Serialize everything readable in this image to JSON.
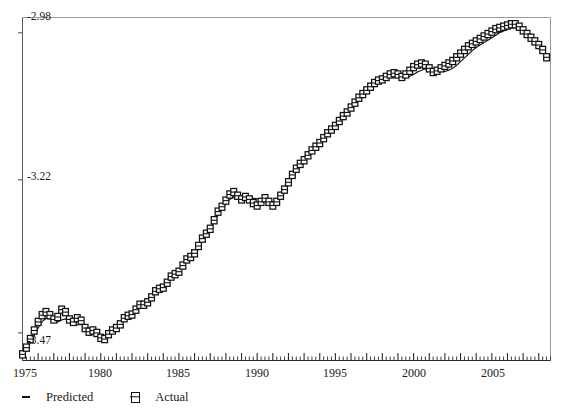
{
  "chart_data": {
    "type": "line",
    "title": "",
    "xlabel": "",
    "ylabel": "",
    "xlim": [
      1975.0,
      2008.75
    ],
    "ylim": [
      -3.515,
      -2.955
    ],
    "grid": false,
    "legend_position": "bottom-left",
    "y_ticks": [
      -2.98,
      -3.22,
      -3.47
    ],
    "y_tick_labels": [
      "-2.98",
      "-3.22",
      "-3.47"
    ],
    "x_ticks": [
      1975,
      1980,
      1985,
      1990,
      1995,
      2000,
      2005
    ],
    "x_tick_labels": [
      "1975",
      "1980",
      "1985",
      "1990",
      "1995",
      "2000",
      "2005"
    ],
    "x_minor_tick_interval": 0.25,
    "x_major_tick_interval": 1,
    "series": [
      {
        "name": "Predicted",
        "marker": "dash",
        "color": "#111111",
        "x": [
          1975.0,
          1975.25,
          1975.5,
          1975.75,
          1976.0,
          1976.25,
          1976.5,
          1976.75,
          1977.0,
          1977.25,
          1977.5,
          1977.75,
          1978.0,
          1978.25,
          1978.5,
          1978.75,
          1979.0,
          1979.25,
          1979.5,
          1979.75,
          1980.0,
          1980.25,
          1980.5,
          1980.75,
          1981.0,
          1981.25,
          1981.5,
          1981.75,
          1982.0,
          1982.25,
          1982.5,
          1982.75,
          1983.0,
          1983.25,
          1983.5,
          1983.75,
          1984.0,
          1984.25,
          1984.5,
          1984.75,
          1985.0,
          1985.25,
          1985.5,
          1985.75,
          1986.0,
          1986.25,
          1986.5,
          1986.75,
          1987.0,
          1987.25,
          1987.5,
          1987.75,
          1988.0,
          1988.25,
          1988.5,
          1988.75,
          1989.0,
          1989.25,
          1989.5,
          1989.75,
          1990.0,
          1990.25,
          1990.5,
          1990.75,
          1991.0,
          1991.25,
          1991.5,
          1991.75,
          1992.0,
          1992.25,
          1992.5,
          1992.75,
          1993.0,
          1993.25,
          1993.5,
          1993.75,
          1994.0,
          1994.25,
          1994.5,
          1994.75,
          1995.0,
          1995.25,
          1995.5,
          1995.75,
          1996.0,
          1996.25,
          1996.5,
          1996.75,
          1997.0,
          1997.25,
          1997.5,
          1997.75,
          1998.0,
          1998.25,
          1998.5,
          1998.75,
          1999.0,
          1999.25,
          1999.5,
          1999.75,
          2000.0,
          2000.25,
          2000.5,
          2000.75,
          2001.0,
          2001.25,
          2001.5,
          2001.75,
          2002.0,
          2002.25,
          2002.5,
          2002.75,
          2003.0,
          2003.25,
          2003.5,
          2003.75,
          2004.0,
          2004.25,
          2004.5,
          2004.75,
          2005.0,
          2005.25,
          2005.5,
          2005.75,
          2006.0,
          2006.25,
          2006.5,
          2006.75,
          2007.0,
          2007.25,
          2007.5,
          2007.75,
          2008.0,
          2008.25,
          2008.5
        ],
        "y": [
          -3.503,
          -3.496,
          -3.487,
          -3.475,
          -3.462,
          -3.452,
          -3.446,
          -3.447,
          -3.451,
          -3.452,
          -3.449,
          -3.447,
          -3.449,
          -3.454,
          -3.457,
          -3.456,
          -3.458,
          -3.463,
          -3.468,
          -3.472,
          -3.474,
          -3.475,
          -3.474,
          -3.47,
          -3.464,
          -3.457,
          -3.45,
          -3.444,
          -3.438,
          -3.432,
          -3.427,
          -3.423,
          -3.418,
          -3.412,
          -3.405,
          -3.398,
          -3.392,
          -3.386,
          -3.38,
          -3.374,
          -3.367,
          -3.36,
          -3.353,
          -3.346,
          -3.338,
          -3.329,
          -3.32,
          -3.31,
          -3.3,
          -3.289,
          -3.278,
          -3.268,
          -3.259,
          -3.252,
          -3.248,
          -3.247,
          -3.247,
          -3.248,
          -3.249,
          -3.25,
          -3.251,
          -3.252,
          -3.253,
          -3.255,
          -3.256,
          -3.254,
          -3.249,
          -3.24,
          -3.228,
          -3.215,
          -3.203,
          -3.192,
          -3.183,
          -3.176,
          -3.17,
          -3.164,
          -3.157,
          -3.15,
          -3.143,
          -3.136,
          -3.129,
          -3.122,
          -3.115,
          -3.108,
          -3.1,
          -3.093,
          -3.086,
          -3.079,
          -3.073,
          -3.068,
          -3.063,
          -3.059,
          -3.056,
          -3.054,
          -3.053,
          -3.053,
          -3.053,
          -3.054,
          -3.053,
          -3.051,
          -3.048,
          -3.044,
          -3.041,
          -3.039,
          -3.039,
          -3.04,
          -3.042,
          -3.043,
          -3.043,
          -3.041,
          -3.038,
          -3.033,
          -3.027,
          -3.021,
          -3.015,
          -3.009,
          -3.004,
          -3.0,
          -2.996,
          -2.992,
          -2.988,
          -2.984,
          -2.98,
          -2.977,
          -2.974,
          -2.972,
          -2.971,
          -2.972,
          -2.975,
          -2.98,
          -2.986,
          -2.993,
          -3.0,
          -3.008,
          -3.018
        ]
      },
      {
        "name": "Actual",
        "marker": "square",
        "color": "#111111",
        "x": [
          1975.0,
          1975.25,
          1975.5,
          1975.75,
          1976.0,
          1976.25,
          1976.5,
          1976.75,
          1977.0,
          1977.25,
          1977.5,
          1977.75,
          1978.0,
          1978.25,
          1978.5,
          1978.75,
          1979.0,
          1979.25,
          1979.5,
          1979.75,
          1980.0,
          1980.25,
          1980.5,
          1980.75,
          1981.0,
          1981.25,
          1981.5,
          1981.75,
          1982.0,
          1982.25,
          1982.5,
          1982.75,
          1983.0,
          1983.25,
          1983.5,
          1983.75,
          1984.0,
          1984.25,
          1984.5,
          1984.75,
          1985.0,
          1985.25,
          1985.5,
          1985.75,
          1986.0,
          1986.25,
          1986.5,
          1986.75,
          1987.0,
          1987.25,
          1987.5,
          1987.75,
          1988.0,
          1988.25,
          1988.5,
          1988.75,
          1989.0,
          1989.25,
          1989.5,
          1989.75,
          1990.0,
          1990.25,
          1990.5,
          1990.75,
          1991.0,
          1991.25,
          1991.5,
          1991.75,
          1992.0,
          1992.25,
          1992.5,
          1992.75,
          1993.0,
          1993.25,
          1993.5,
          1993.75,
          1994.0,
          1994.25,
          1994.5,
          1994.75,
          1995.0,
          1995.25,
          1995.5,
          1995.75,
          1996.0,
          1996.25,
          1996.5,
          1996.75,
          1997.0,
          1997.25,
          1997.5,
          1997.75,
          1998.0,
          1998.25,
          1998.5,
          1998.75,
          1999.0,
          1999.25,
          1999.5,
          1999.75,
          2000.0,
          2000.25,
          2000.5,
          2000.75,
          2001.0,
          2001.25,
          2001.5,
          2001.75,
          2002.0,
          2002.25,
          2002.5,
          2002.75,
          2003.0,
          2003.25,
          2003.5,
          2003.75,
          2004.0,
          2004.25,
          2004.5,
          2004.75,
          2005.0,
          2005.25,
          2005.5,
          2005.75,
          2006.0,
          2006.25,
          2006.5,
          2006.75,
          2007.0,
          2007.25,
          2007.5,
          2007.75,
          2008.0,
          2008.25,
          2008.5
        ],
        "y": [
          -3.505,
          -3.494,
          -3.48,
          -3.466,
          -3.452,
          -3.441,
          -3.436,
          -3.441,
          -3.448,
          -3.444,
          -3.432,
          -3.436,
          -3.448,
          -3.452,
          -3.446,
          -3.45,
          -3.462,
          -3.468,
          -3.466,
          -3.47,
          -3.478,
          -3.48,
          -3.472,
          -3.466,
          -3.462,
          -3.456,
          -3.446,
          -3.442,
          -3.44,
          -3.432,
          -3.424,
          -3.424,
          -3.42,
          -3.412,
          -3.402,
          -3.398,
          -3.396,
          -3.388,
          -3.378,
          -3.374,
          -3.37,
          -3.36,
          -3.35,
          -3.346,
          -3.34,
          -3.328,
          -3.316,
          -3.308,
          -3.3,
          -3.286,
          -3.272,
          -3.264,
          -3.254,
          -3.244,
          -3.24,
          -3.246,
          -3.252,
          -3.248,
          -3.252,
          -3.258,
          -3.262,
          -3.256,
          -3.25,
          -3.256,
          -3.262,
          -3.256,
          -3.246,
          -3.236,
          -3.224,
          -3.212,
          -3.202,
          -3.194,
          -3.188,
          -3.18,
          -3.172,
          -3.166,
          -3.16,
          -3.152,
          -3.144,
          -3.138,
          -3.132,
          -3.124,
          -3.116,
          -3.11,
          -3.102,
          -3.094,
          -3.086,
          -3.08,
          -3.074,
          -3.068,
          -3.062,
          -3.058,
          -3.056,
          -3.052,
          -3.048,
          -3.046,
          -3.048,
          -3.052,
          -3.048,
          -3.042,
          -3.036,
          -3.032,
          -3.03,
          -3.032,
          -3.038,
          -3.044,
          -3.042,
          -3.038,
          -3.034,
          -3.03,
          -3.026,
          -3.02,
          -3.014,
          -3.008,
          -3.002,
          -2.998,
          -2.994,
          -2.99,
          -2.986,
          -2.982,
          -2.978,
          -2.974,
          -2.972,
          -2.97,
          -2.968,
          -2.966,
          -2.966,
          -2.97,
          -2.976,
          -2.982,
          -2.988,
          -2.994,
          -3.0,
          -3.008,
          -3.02
        ]
      }
    ]
  },
  "legend": {
    "entries": [
      {
        "label": "Predicted",
        "marker": "dash"
      },
      {
        "label": "Actual",
        "marker": "square"
      }
    ]
  },
  "axes": {
    "y_tick_labels": [
      "-2.98",
      "-3.22",
      "-3.47"
    ],
    "x_tick_labels": [
      "1975",
      "1980",
      "1985",
      "1990",
      "1995",
      "2000",
      "2005"
    ]
  }
}
